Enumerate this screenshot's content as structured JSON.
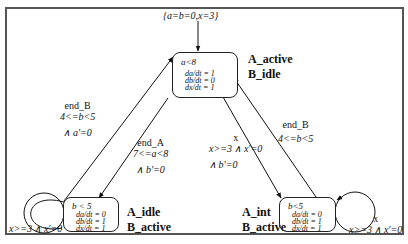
{
  "initial": {
    "label": "{a=b=0,x=3}"
  },
  "states": [
    {
      "id": "top",
      "invariant": "a<8",
      "flows": [
        "da/dt = 1",
        "db/dt = 0",
        "dx/dt = 1"
      ],
      "modes": [
        "A_active",
        "B_idle"
      ]
    },
    {
      "id": "bottom_left",
      "invariant": "b < 5",
      "flows": [
        "da/dt = 0",
        "db/dt = 1",
        "dx/dt = 1"
      ],
      "modes": [
        "A_idle",
        "B_active"
      ]
    },
    {
      "id": "bottom_right",
      "invariant": "b<5",
      "flows": [
        "da/dt = 0",
        "db/dt = 1",
        "dx/dt = 1"
      ],
      "modes": [
        "A_int",
        "B_active"
      ]
    }
  ],
  "transitions": [
    {
      "id": "left_up",
      "lines": [
        "end_B",
        "4<=b<5",
        "∧ a'=0"
      ]
    },
    {
      "id": "left_down",
      "lines": [
        "end_A",
        "7<=a<8",
        "∧ b'=0"
      ]
    },
    {
      "id": "mid_down",
      "lines": [
        "x",
        "x>=3 ∧ x'=0",
        "∧ b'=0"
      ]
    },
    {
      "id": "right_up",
      "lines": [
        "end_B",
        "4<=b<5"
      ]
    },
    {
      "id": "self_left",
      "lines": [
        "x>=3 ∧ x'=0"
      ]
    },
    {
      "id": "self_right",
      "lines": [
        "x",
        "x>=3 ∧ x'=0"
      ]
    }
  ]
}
